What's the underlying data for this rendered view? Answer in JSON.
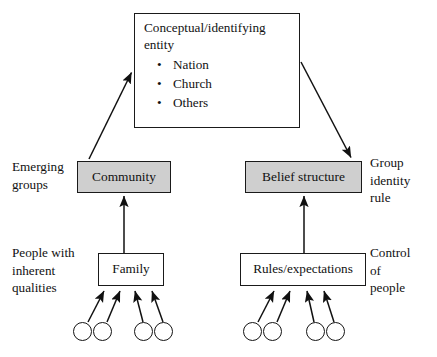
{
  "diagram": {
    "colors": {
      "shaded_fill": "#cfcfcf",
      "plain_fill": "#ffffff",
      "stroke": "#1a1a1a",
      "background": "#ffffff"
    },
    "nodes": {
      "conceptual": {
        "heading": "Conceptual/identifying entity",
        "bullet_glyph": "•",
        "items": [
          "Nation",
          "Church",
          "Others"
        ]
      },
      "community": {
        "label": "Community",
        "style": "shaded"
      },
      "belief_structure": {
        "label": "Belief structure",
        "style": "shaded"
      },
      "family": {
        "label": "Family",
        "style": "plain"
      },
      "rules_expectations": {
        "label": "Rules/expectations",
        "style": "plain"
      }
    },
    "side_labels": {
      "emerging_groups": "Emerging\ngroups",
      "people_with_inherent_qualities": "People with\ninherent\nqualities",
      "group_identity_rule": "Group\nidentity\nrule",
      "control_of_people": "Control\nof\npeople"
    },
    "person_circles": {
      "left_group_count": 4,
      "right_group_count": 4,
      "total": 8
    },
    "edges": [
      {
        "name": "community-to-conceptual",
        "from": "community",
        "to": "conceptual",
        "style": "solid-arrow",
        "direction": "up-right"
      },
      {
        "name": "conceptual-to-belief-structure",
        "from": "conceptual",
        "to": "belief_structure",
        "style": "solid-arrow",
        "direction": "down-right"
      },
      {
        "name": "family-to-community",
        "from": "family",
        "to": "community",
        "style": "solid-arrow",
        "direction": "up"
      },
      {
        "name": "rules-to-belief-structure",
        "from": "rules_expectations",
        "to": "belief_structure",
        "style": "solid-arrow",
        "direction": "up"
      },
      {
        "name": "people-to-family",
        "from": "person_circles_left",
        "to": "family",
        "style": "solid-arrow",
        "direction": "up"
      },
      {
        "name": "people-to-rules",
        "from": "person_circles_right",
        "to": "rules_expectations",
        "style": "solid-arrow",
        "direction": "up"
      }
    ]
  }
}
